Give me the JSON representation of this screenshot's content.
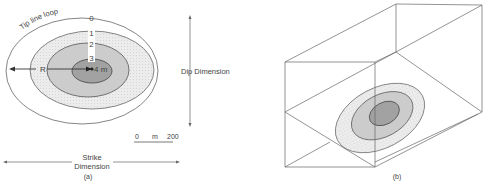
{
  "panel_a": {
    "caption": "(a)",
    "tip_line_label": "Tip line loop",
    "contour_labels": [
      "0",
      "1",
      "2",
      "3"
    ],
    "radius_label": "R",
    "center_label": "4 m",
    "dip_label": "Dip Dimension",
    "strike_label_line1": "Strike",
    "strike_label_line2": "Dimension",
    "scale": {
      "start": "0",
      "unit": "m",
      "end": "200"
    }
  },
  "panel_b": {
    "caption": "(b)"
  },
  "colors": {
    "line": "#555555",
    "fill_1": "#eeeeee",
    "fill_2": "#d4d4d4",
    "fill_3": "#a8a8a8",
    "text": "#444444"
  }
}
